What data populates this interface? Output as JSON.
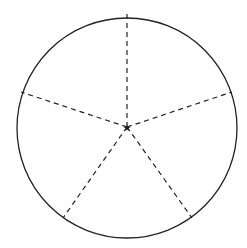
{
  "diagram": {
    "type": "circle-divided-into-sectors",
    "sectors": 5,
    "center": {
      "x": 127,
      "y": 127
    },
    "radius": 110,
    "stroke_color": "#222222",
    "radii_style": "dashed",
    "radii_endpoints": [
      {
        "x": 127,
        "y": 17
      },
      {
        "x": 231.6,
        "y": 93
      },
      {
        "x": 191.7,
        "y": 216
      },
      {
        "x": 62.3,
        "y": 216
      },
      {
        "x": 22.4,
        "y": 93
      }
    ],
    "center_marker": "star"
  }
}
